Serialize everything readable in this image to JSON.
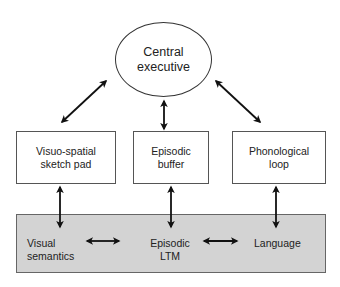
{
  "diagram": {
    "central_executive": {
      "lines": [
        "Central",
        "executive"
      ]
    },
    "subsystems": [
      {
        "id": "visuo-spatial",
        "lines": [
          "Visuo-spatial",
          "sketch pad"
        ]
      },
      {
        "id": "episodic-buffer",
        "lines": [
          "Episodic",
          "buffer"
        ]
      },
      {
        "id": "phonological-loop",
        "lines": [
          "Phonological",
          "loop"
        ]
      }
    ],
    "long_term_memory": {
      "fill_color": "#d3d3d3",
      "items": [
        {
          "id": "visual-semantics",
          "lines": [
            "Visual",
            "semantics"
          ]
        },
        {
          "id": "episodic-ltm",
          "lines": [
            "Episodic",
            "LTM"
          ]
        },
        {
          "id": "language",
          "lines": [
            "Language"
          ]
        }
      ]
    },
    "connections": [
      {
        "from": "central-executive",
        "to": "visuo-spatial",
        "type": "bidirectional"
      },
      {
        "from": "central-executive",
        "to": "episodic-buffer",
        "type": "bidirectional"
      },
      {
        "from": "central-executive",
        "to": "phonological-loop",
        "type": "bidirectional"
      },
      {
        "from": "visuo-spatial",
        "to": "visual-semantics",
        "type": "bidirectional"
      },
      {
        "from": "episodic-buffer",
        "to": "episodic-ltm",
        "type": "bidirectional"
      },
      {
        "from": "phonological-loop",
        "to": "language",
        "type": "bidirectional"
      },
      {
        "from": "visual-semantics",
        "to": "episodic-ltm",
        "type": "bidirectional"
      },
      {
        "from": "episodic-ltm",
        "to": "language",
        "type": "bidirectional"
      }
    ]
  }
}
